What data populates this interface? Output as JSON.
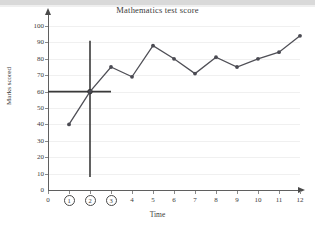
{
  "chart_data": {
    "type": "line",
    "title": "Mathematics test score",
    "xlabel": "Time",
    "ylabel": "Marks scored",
    "x": [
      1,
      2,
      3,
      4,
      5,
      6,
      7,
      8,
      9,
      10,
      11,
      12
    ],
    "values": [
      40,
      60,
      75,
      69,
      88,
      80,
      71,
      81,
      75,
      80,
      84,
      94
    ],
    "series": [
      {
        "name": "Marks scored",
        "values": [
          40,
          60,
          75,
          69,
          88,
          80,
          71,
          81,
          75,
          80,
          84,
          94
        ]
      }
    ],
    "xlim": [
      0,
      12
    ],
    "ylim": [
      0,
      100
    ],
    "xticks": [
      0,
      1,
      2,
      3,
      4,
      5,
      6,
      7,
      8,
      9,
      10,
      11,
      12
    ],
    "xtick_labels": [
      "0",
      "1",
      "2",
      "3",
      "4",
      "5",
      "6",
      "7",
      "8",
      "9",
      "10",
      "11",
      "12"
    ],
    "circled_xticks": [
      "1",
      "2",
      "3"
    ],
    "yticks": [
      0,
      10,
      20,
      30,
      40,
      50,
      60,
      70,
      80,
      90,
      100
    ],
    "ytick_labels": [
      "0",
      "10",
      "20",
      "30",
      "40",
      "50",
      "60",
      "70",
      "80",
      "90",
      "100"
    ],
    "grid": true,
    "grid_axis": "y",
    "legend": "none",
    "marker": "circle",
    "line_color": "#4f4f56",
    "marker_color": "#4a4a52",
    "grid_color": "#f0f0f0",
    "axis_color": "#5f5f5f",
    "annotations": [
      {
        "name": "vertical-reference-line",
        "type": "vline",
        "x": 2,
        "y_from": 8,
        "y_to": 91,
        "color": "#3a3a3a"
      },
      {
        "name": "horizontal-reference-line",
        "type": "hline",
        "y": 60,
        "x_from": 0,
        "x_to": 3,
        "color": "#3a3a3a"
      },
      {
        "name": "intersection-marker",
        "type": "point",
        "x": 2,
        "y": 60,
        "color": "#2e2e2e"
      }
    ]
  }
}
